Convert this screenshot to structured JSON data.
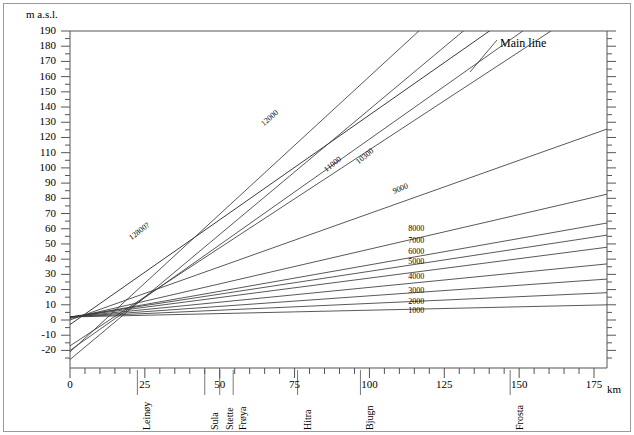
{
  "axes": {
    "y_title": "m a.s.l.",
    "x_unit": "km",
    "y_ticks": [
      190,
      180,
      170,
      160,
      150,
      140,
      130,
      120,
      110,
      100,
      90,
      80,
      70,
      60,
      50,
      40,
      30,
      20,
      10,
      0,
      -10,
      -20
    ],
    "x_ticks": [
      0,
      25,
      50,
      75,
      100,
      125,
      150,
      175
    ]
  },
  "places": [
    {
      "name": "Leinøy",
      "km": 22.5
    },
    {
      "name": "Sula",
      "km": 45.0
    },
    {
      "name": "Stette",
      "km": 50.0
    },
    {
      "name": "Frøya",
      "km": 54.5
    },
    {
      "name": "Hitra",
      "km": 76.0
    },
    {
      "name": "Bjugn",
      "km": 97.0
    },
    {
      "name": "Frosta",
      "km": 147.0
    }
  ],
  "annotations": {
    "main_line": "Main line"
  },
  "chart_data": {
    "type": "line",
    "title": "",
    "xlabel": "km",
    "ylabel": "m a.s.l.",
    "xlim": [
      0,
      180
    ],
    "ylim": [
      -27,
      192
    ],
    "grid": false,
    "legend": "inline-labels",
    "x": [
      0,
      180
    ],
    "series": [
      {
        "name": "Main line",
        "label": "Main line",
        "label_km": 133,
        "label_masl": 185,
        "label_angle": 0,
        "values": [
          -3.0,
          245.0
        ],
        "label_anchor": "leader"
      },
      {
        "name": "10300",
        "label": "10300",
        "label_km": 96,
        "label_masl": 103,
        "label_angle": -39,
        "values": [
          -20.0,
          230.0
        ]
      },
      {
        "name": "11000",
        "label": "11000",
        "label_km": 85,
        "label_masl": 98,
        "label_angle": -39,
        "values": [
          -17.0,
          215.0
        ]
      },
      {
        "name": "12000",
        "label": "12000",
        "label_km": 64,
        "label_masl": 128,
        "label_angle": -41,
        "values": [
          -21.0,
          305.0
        ]
      },
      {
        "name": "12800?",
        "label": "12800?",
        "label_km": 20,
        "label_masl": 53,
        "label_angle": -38,
        "values": [
          -26.0,
          270.0
        ]
      },
      {
        "name": "9000",
        "label": "9000",
        "label_km": 108,
        "label_masl": 84,
        "label_angle": -22,
        "values": [
          0.0,
          126.0
        ]
      },
      {
        "name": "8000",
        "label": "8000",
        "label_km": 113,
        "label_masl": 60,
        "label_angle": 0,
        "values": [
          1.0,
          83.0
        ]
      },
      {
        "name": "7000",
        "label": "7000",
        "label_km": 113,
        "label_masl": 52,
        "label_angle": 0,
        "values": [
          1.5,
          64.0
        ]
      },
      {
        "name": "6000",
        "label": "6000",
        "label_km": 113,
        "label_masl": 45,
        "label_angle": 0,
        "values": [
          2.0,
          56.0
        ]
      },
      {
        "name": "5000",
        "label": "5000",
        "label_km": 113,
        "label_masl": 38,
        "label_angle": 0,
        "values": [
          2.0,
          48.0
        ]
      },
      {
        "name": "4000",
        "label": "4000",
        "label_km": 113,
        "label_masl": 28,
        "label_angle": 0,
        "values": [
          2.0,
          37.0
        ]
      },
      {
        "name": "3000",
        "label": "3000",
        "label_km": 113,
        "label_masl": 19,
        "label_angle": 0,
        "values": [
          2.0,
          27.0
        ]
      },
      {
        "name": "2000",
        "label": "2000",
        "label_km": 113,
        "label_masl": 12,
        "label_angle": 0,
        "values": [
          2.0,
          18.0
        ]
      },
      {
        "name": "1000",
        "label": "1000",
        "label_km": 113,
        "label_masl": 6,
        "label_angle": 0,
        "values": [
          2.0,
          10.0
        ]
      }
    ]
  }
}
